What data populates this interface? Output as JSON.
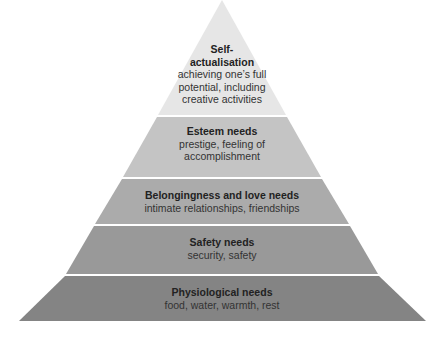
{
  "diagram": {
    "type": "pyramid",
    "levels": [
      {
        "title": "Self-\nactualisation",
        "title_l1": "Self-",
        "title_l2": "actualisation",
        "desc_l1": "achieving one’s full",
        "desc_l2": "potential, including",
        "desc_l3": "creative activities",
        "color": "#e4e4e4"
      },
      {
        "title": "Esteem needs",
        "desc_l1": "prestige, feeling of",
        "desc_l2": "accomplishment",
        "color": "#c3c3c3"
      },
      {
        "title": "Belongingness and love needs",
        "desc_l1": "intimate relationships, friendships",
        "color": "#a9a9a9"
      },
      {
        "title": "Safety needs",
        "desc_l1": "security, safety",
        "color": "#989898"
      },
      {
        "title": "Physiological needs",
        "desc_l1": "food, water, warmth, rest",
        "color": "#838383"
      }
    ]
  }
}
